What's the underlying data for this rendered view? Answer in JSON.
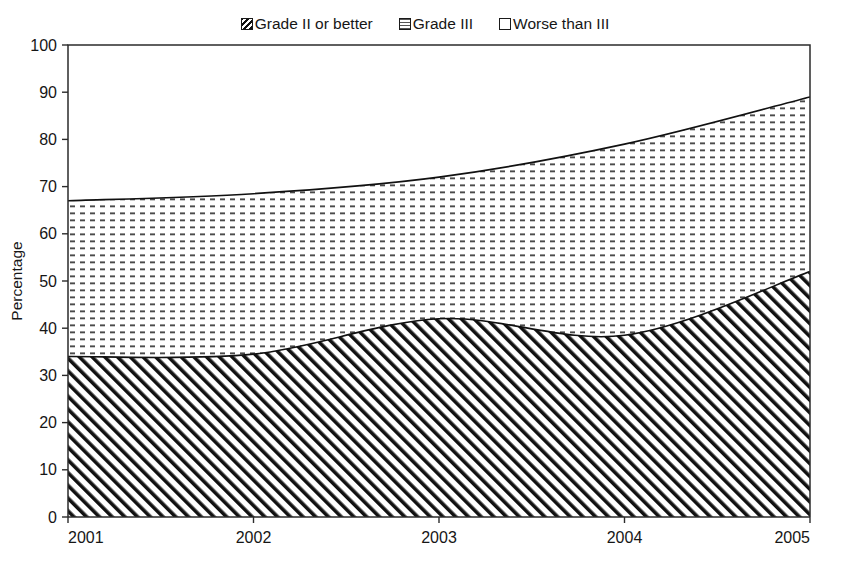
{
  "legend": {
    "position": "top-center",
    "entries": [
      {
        "label": "Grade II or better",
        "swatch": "diagonal-hatch-swatch-icon",
        "pattern": "diagonal-hatch"
      },
      {
        "label": "Grade III",
        "swatch": "dash-fill-swatch-icon",
        "pattern": "fine-dash"
      },
      {
        "label": "Worse than III",
        "swatch": "empty-swatch-icon",
        "pattern": "none"
      }
    ]
  },
  "chart_data": {
    "type": "area",
    "title": "",
    "subtitle": "",
    "xlabel": "",
    "ylabel": "Percentage",
    "stacked": true,
    "grid": false,
    "legend_position": "top-center",
    "x": [
      2001,
      2002,
      2003,
      2004,
      2005
    ],
    "categories": [
      "2001",
      "2002",
      "2003",
      "2004",
      "2005"
    ],
    "xtick_labels": [
      "2001",
      "2002",
      "2003",
      "2004",
      "2005"
    ],
    "ytick_labels": [
      "0",
      "10",
      "20",
      "30",
      "40",
      "50",
      "60",
      "70",
      "80",
      "90",
      "100"
    ],
    "xlim": [
      2001,
      2005
    ],
    "ylim": [
      0,
      100
    ],
    "series": [
      {
        "name": "Grade II or better",
        "values": [
          34,
          34.5,
          42,
          38.5,
          52
        ],
        "pattern": "diagonal-hatch"
      },
      {
        "name": "Grade III",
        "values": [
          33,
          34,
          30,
          40.5,
          37
        ],
        "pattern": "fine-dash"
      },
      {
        "name": "Worse than III",
        "values": [
          33,
          31.5,
          28,
          21,
          11
        ],
        "pattern": "none"
      }
    ],
    "cumulative_boundaries": {
      "grade_ii_or_better_top": [
        34,
        34.5,
        42,
        38.5,
        52
      ],
      "grade_iii_top": [
        67,
        68.5,
        72,
        79,
        89
      ]
    },
    "annotations": []
  },
  "axes": {
    "y_title": "Percentage",
    "y_ticks": [
      0,
      10,
      20,
      30,
      40,
      50,
      60,
      70,
      80,
      90,
      100
    ],
    "x_ticks": [
      "2001",
      "2002",
      "2003",
      "2004",
      "2005"
    ]
  }
}
